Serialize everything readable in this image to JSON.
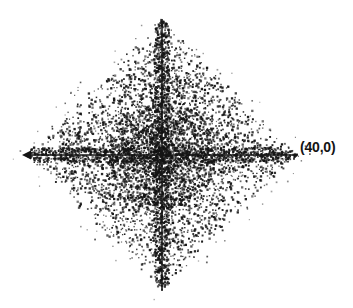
{
  "figure": {
    "width": 353,
    "height": 308,
    "background_color": "#ffffff",
    "ink_color": "#141414"
  },
  "annotations": {
    "right_vertex_label": "(40,0)"
  },
  "chart_data": {
    "type": "scatter",
    "title": "",
    "subtitle": "",
    "xlabel": "",
    "ylabel": "",
    "grid": false,
    "legend": null,
    "legend_position": "none",
    "region": "|x| + |y| <= 40",
    "n_points": 6000,
    "marker": {
      "shape": "square",
      "size_px": 1.6,
      "color": "#141414"
    },
    "xlim": [
      -40,
      40
    ],
    "ylim": [
      -40,
      40
    ],
    "xticks": [],
    "yticks": [],
    "xticklabels": [],
    "yticklabels": [],
    "axes": {
      "x_axis": {
        "visible": true,
        "y_value": 0,
        "from_x": -40,
        "to_x": 40,
        "arrow_start": true,
        "arrow_end": false
      },
      "y_axis": {
        "visible": true,
        "x_value": 0,
        "from_y": -40,
        "to_y": 40,
        "arrow_start": false,
        "arrow_end": false
      }
    },
    "annotated_points": [
      {
        "label": "(40,0)",
        "x": 40,
        "y": 0
      }
    ],
    "vertices": [
      {
        "x": 0,
        "y": 40
      },
      {
        "x": 40,
        "y": 0
      },
      {
        "x": 0,
        "y": -40
      },
      {
        "x": -40,
        "y": 0
      }
    ],
    "pixel_geometry": {
      "origin_px": {
        "x": 162,
        "y": 155
      },
      "scale_px_per_unit": 3.4,
      "top_vertex_px": {
        "x": 162,
        "y": 19
      },
      "bottom_vertex_px": {
        "x": 162,
        "y": 291
      },
      "left_vertex_px": {
        "x": 26,
        "y": 155
      },
      "right_vertex_px": {
        "x": 298,
        "y": 155
      }
    }
  }
}
